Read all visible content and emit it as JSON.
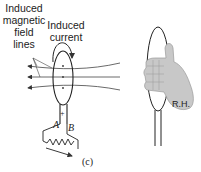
{
  "figure": {
    "labels": {
      "field_lines": "Induced magnetic field lines",
      "field_lines_lines": [
        "Induced",
        "magnetic",
        "field",
        "lines"
      ],
      "current": "Induced current",
      "current_lines": [
        "Induced",
        "current"
      ],
      "terminal_a": "A",
      "terminal_b": "B",
      "polarity": "+",
      "right_hand": "R.H.",
      "caption": "(c)"
    },
    "colors": {
      "line": "#333333",
      "hand_fill": "#c8c8c8",
      "hand_stroke": "#999999"
    }
  }
}
